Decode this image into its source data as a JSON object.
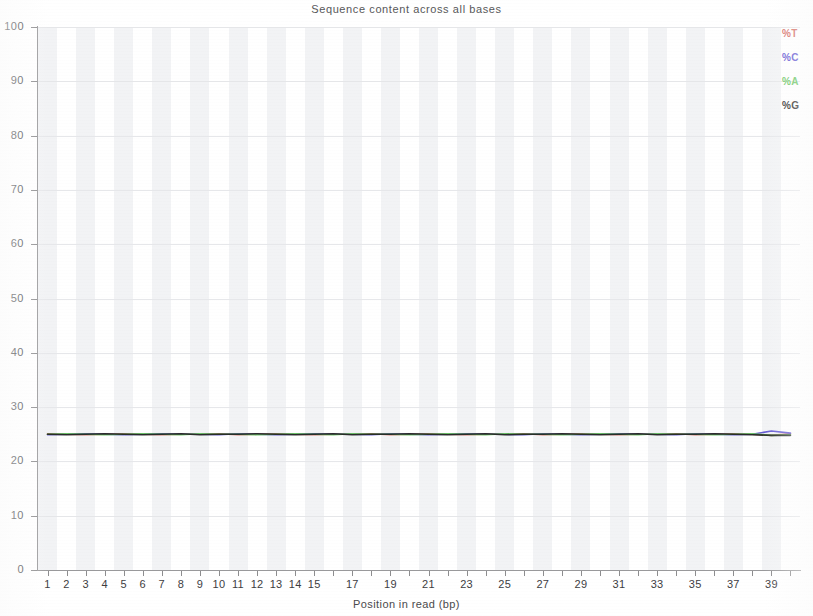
{
  "chart_data": {
    "type": "line",
    "title": "Sequence content across all bases",
    "xlabel": "Position in read (bp)",
    "ylabel": "",
    "xlim": [
      0.5,
      40.5
    ],
    "ylim": [
      0,
      100
    ],
    "grid": true,
    "legend_position": "top-right",
    "x": [
      1,
      2,
      3,
      4,
      5,
      6,
      7,
      8,
      9,
      10,
      11,
      12,
      13,
      14,
      15,
      16,
      17,
      18,
      19,
      20,
      21,
      22,
      23,
      24,
      25,
      26,
      27,
      28,
      29,
      30,
      31,
      32,
      33,
      34,
      35,
      36,
      37,
      38,
      39,
      40
    ],
    "xtick_labels": [
      "1",
      "2",
      "3",
      "4",
      "5",
      "6",
      "7",
      "8",
      "9",
      "10",
      "11",
      "12",
      "13",
      "14",
      "15",
      "",
      "17",
      "",
      "19",
      "",
      "21",
      "",
      "23",
      "",
      "25",
      "",
      "27",
      "",
      "29",
      "",
      "31",
      "",
      "33",
      "",
      "35",
      "",
      "37",
      "",
      "39",
      ""
    ],
    "ytick_labels": [
      "0",
      "10",
      "20",
      "30",
      "40",
      "50",
      "60",
      "70",
      "80",
      "90",
      "100"
    ],
    "ytick_values": [
      0,
      10,
      20,
      30,
      40,
      50,
      60,
      70,
      80,
      90,
      100
    ],
    "series": [
      {
        "name": "%T",
        "color": "#d4685f",
        "values": [
          25.1,
          25.0,
          24.9,
          25.0,
          25.1,
          25.0,
          24.9,
          25.0,
          25.0,
          25.1,
          24.9,
          25.0,
          25.1,
          25.0,
          24.9,
          25.0,
          25.0,
          25.1,
          24.9,
          25.0,
          25.1,
          25.0,
          24.9,
          25.0,
          25.0,
          25.1,
          24.9,
          25.0,
          25.1,
          25.0,
          24.9,
          25.0,
          25.0,
          25.1,
          24.9,
          25.0,
          25.1,
          25.0,
          24.8,
          25.1
        ]
      },
      {
        "name": "%C",
        "color": "#5b4fd0",
        "values": [
          24.9,
          25.0,
          25.1,
          25.0,
          24.9,
          25.0,
          25.1,
          25.0,
          25.0,
          24.9,
          25.1,
          25.0,
          24.9,
          25.0,
          25.1,
          25.0,
          25.0,
          24.9,
          25.1,
          25.0,
          24.9,
          25.0,
          25.1,
          25.0,
          25.0,
          24.9,
          25.1,
          25.0,
          24.9,
          25.0,
          25.1,
          25.0,
          25.0,
          24.9,
          25.1,
          25.0,
          24.9,
          25.0,
          25.6,
          25.2
        ]
      },
      {
        "name": "%A",
        "color": "#63c45c",
        "values": [
          25.0,
          25.1,
          25.0,
          24.9,
          25.0,
          25.1,
          25.0,
          24.9,
          25.1,
          25.0,
          25.0,
          24.9,
          25.0,
          25.1,
          25.0,
          24.9,
          25.1,
          25.0,
          25.0,
          24.9,
          25.0,
          25.1,
          25.0,
          24.9,
          25.1,
          25.0,
          25.0,
          24.9,
          25.0,
          25.1,
          25.0,
          24.9,
          25.1,
          25.0,
          25.0,
          24.9,
          25.0,
          25.1,
          24.8,
          24.9
        ]
      },
      {
        "name": "%G",
        "color": "#232323",
        "values": [
          25.0,
          24.9,
          25.0,
          25.1,
          25.0,
          24.9,
          25.0,
          25.1,
          24.9,
          25.0,
          25.0,
          25.1,
          25.0,
          24.9,
          25.0,
          25.1,
          24.9,
          25.0,
          25.0,
          25.1,
          25.0,
          24.9,
          25.0,
          25.1,
          24.9,
          25.0,
          25.0,
          25.1,
          25.0,
          24.9,
          25.0,
          25.1,
          24.9,
          25.0,
          25.0,
          25.1,
          25.0,
          24.9,
          24.8,
          24.8
        ]
      }
    ]
  },
  "legend": {
    "items": [
      {
        "label": "%T",
        "color": "#d4685f"
      },
      {
        "label": "%C",
        "color": "#5b4fd0"
      },
      {
        "label": "%A",
        "color": "#63c45c"
      },
      {
        "label": "%G",
        "color": "#232323"
      }
    ]
  }
}
